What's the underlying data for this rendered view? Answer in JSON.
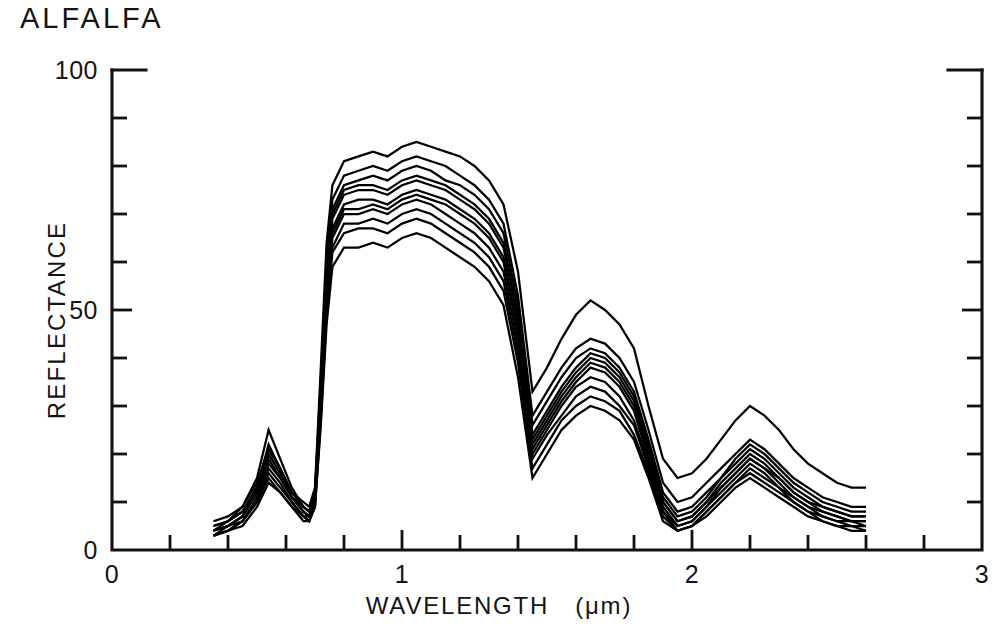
{
  "figure": {
    "title": "ALFALFA",
    "background_color": "#ffffff",
    "ink_color": "#000000"
  },
  "axes": {
    "y_title": "REFLECTANCE",
    "x_title_main": "WAVELENGTH",
    "x_title_unit": "(μm)",
    "y_tick_labels": [
      "0",
      "50",
      "100"
    ],
    "x_tick_labels": [
      "0",
      "1",
      "2",
      "3"
    ]
  },
  "chart_data": {
    "type": "line",
    "title": "ALFALFA",
    "subtitle": "",
    "xlabel": "WAVELENGTH  (μm)",
    "ylabel": "REFLECTANCE",
    "xlim": [
      0,
      3
    ],
    "ylim": [
      0,
      100
    ],
    "x_major_ticks": [
      0,
      1,
      2,
      3
    ],
    "x_minor_tick_step": 0.2,
    "y_major_ticks": [
      0,
      50,
      100
    ],
    "y_minor_tick_step": 10,
    "grid": false,
    "legend": null,
    "legend_position": "none",
    "annotations": [],
    "series_count": 11,
    "x": [
      0.35,
      0.4,
      0.45,
      0.5,
      0.54,
      0.58,
      0.62,
      0.66,
      0.68,
      0.7,
      0.72,
      0.74,
      0.76,
      0.8,
      0.85,
      0.9,
      0.95,
      1.0,
      1.05,
      1.1,
      1.15,
      1.2,
      1.25,
      1.3,
      1.35,
      1.4,
      1.45,
      1.5,
      1.55,
      1.6,
      1.65,
      1.7,
      1.75,
      1.8,
      1.85,
      1.9,
      1.95,
      2.0,
      2.05,
      2.1,
      2.15,
      2.2,
      2.25,
      2.3,
      2.35,
      2.4,
      2.45,
      2.5,
      2.55,
      2.6
    ],
    "series": [
      {
        "name": "sample-1",
        "values": [
          6,
          7,
          9,
          14,
          21,
          17,
          12,
          10,
          9,
          13,
          38,
          64,
          76,
          81,
          82,
          83,
          82,
          84,
          85,
          84,
          83,
          82,
          80,
          77,
          72,
          58,
          33,
          38,
          44,
          49,
          52,
          50,
          47,
          42,
          30,
          19,
          15,
          16,
          19,
          23,
          27,
          30,
          28,
          25,
          21,
          18,
          16,
          14,
          13,
          13
        ]
      },
      {
        "name": "sample-2",
        "values": [
          5,
          6,
          8,
          13,
          20,
          16,
          11,
          9,
          8,
          12,
          35,
          60,
          73,
          78,
          79,
          80,
          79,
          81,
          82,
          81,
          80,
          78,
          76,
          73,
          68,
          53,
          28,
          33,
          38,
          42,
          44,
          43,
          40,
          35,
          25,
          14,
          10,
          11,
          14,
          17,
          20,
          23,
          21,
          18,
          15,
          13,
          11,
          10,
          9,
          9
        ]
      },
      {
        "name": "sample-3",
        "values": [
          5,
          6,
          8,
          13,
          22,
          17,
          12,
          9,
          8,
          12,
          34,
          58,
          71,
          76,
          77,
          78,
          77,
          79,
          80,
          79,
          77,
          76,
          74,
          71,
          66,
          51,
          26,
          31,
          36,
          40,
          42,
          41,
          38,
          33,
          23,
          12,
          8,
          9,
          12,
          15,
          19,
          22,
          20,
          17,
          14,
          12,
          10,
          9,
          8,
          8
        ]
      },
      {
        "name": "sample-4",
        "values": [
          4,
          6,
          9,
          15,
          25,
          19,
          13,
          9,
          8,
          12,
          33,
          57,
          70,
          75,
          76,
          76,
          75,
          77,
          78,
          77,
          76,
          74,
          72,
          69,
          64,
          49,
          24,
          29,
          34,
          38,
          41,
          40,
          37,
          32,
          22,
          11,
          7,
          8,
          11,
          15,
          18,
          21,
          19,
          16,
          13,
          11,
          9,
          8,
          7,
          7
        ]
      },
      {
        "name": "sample-5",
        "values": [
          4,
          5,
          7,
          12,
          19,
          15,
          11,
          8,
          7,
          11,
          32,
          56,
          69,
          74,
          75,
          75,
          74,
          76,
          77,
          76,
          75,
          73,
          71,
          68,
          63,
          48,
          23,
          28,
          33,
          37,
          40,
          39,
          36,
          31,
          21,
          10,
          6,
          7,
          10,
          14,
          17,
          20,
          18,
          15,
          12,
          10,
          9,
          8,
          7,
          7
        ]
      },
      {
        "name": "sample-6",
        "values": [
          4,
          5,
          7,
          12,
          18,
          15,
          11,
          8,
          7,
          11,
          31,
          54,
          67,
          72,
          73,
          73,
          72,
          74,
          75,
          74,
          73,
          71,
          69,
          66,
          61,
          46,
          22,
          27,
          32,
          36,
          39,
          38,
          35,
          30,
          20,
          10,
          6,
          7,
          10,
          13,
          16,
          19,
          17,
          15,
          12,
          10,
          8,
          7,
          6,
          6
        ]
      },
      {
        "name": "sample-7",
        "values": [
          4,
          5,
          7,
          13,
          20,
          16,
          11,
          8,
          7,
          11,
          30,
          53,
          66,
          71,
          71,
          72,
          71,
          73,
          74,
          73,
          72,
          70,
          68,
          65,
          60,
          45,
          21,
          26,
          31,
          35,
          38,
          37,
          34,
          29,
          19,
          9,
          5,
          6,
          9,
          13,
          16,
          19,
          17,
          14,
          11,
          9,
          8,
          7,
          6,
          6
        ]
      },
      {
        "name": "sample-8",
        "values": [
          3,
          5,
          6,
          11,
          17,
          14,
          10,
          7,
          7,
          10,
          29,
          52,
          65,
          70,
          70,
          71,
          70,
          72,
          73,
          72,
          70,
          68,
          66,
          63,
          58,
          43,
          20,
          25,
          30,
          34,
          36,
          35,
          32,
          27,
          18,
          8,
          5,
          6,
          9,
          12,
          15,
          18,
          16,
          13,
          11,
          9,
          7,
          6,
          6,
          5
        ]
      },
      {
        "name": "sample-9",
        "values": [
          3,
          4,
          6,
          10,
          16,
          13,
          10,
          7,
          6,
          10,
          28,
          50,
          63,
          68,
          68,
          69,
          68,
          70,
          71,
          70,
          68,
          66,
          64,
          61,
          56,
          41,
          19,
          24,
          28,
          32,
          34,
          33,
          30,
          26,
          17,
          8,
          4,
          5,
          8,
          11,
          14,
          17,
          15,
          13,
          10,
          8,
          7,
          6,
          5,
          5
        ]
      },
      {
        "name": "sample-10",
        "values": [
          3,
          4,
          6,
          10,
          15,
          12,
          9,
          7,
          6,
          9,
          27,
          49,
          62,
          66,
          67,
          67,
          66,
          68,
          69,
          68,
          66,
          64,
          62,
          59,
          54,
          39,
          17,
          22,
          27,
          30,
          32,
          31,
          29,
          24,
          16,
          7,
          4,
          5,
          8,
          11,
          14,
          16,
          14,
          12,
          10,
          8,
          6,
          5,
          5,
          4
        ]
      },
      {
        "name": "sample-11",
        "values": [
          3,
          4,
          5,
          9,
          14,
          12,
          9,
          6,
          6,
          9,
          26,
          47,
          59,
          63,
          63,
          64,
          63,
          65,
          66,
          65,
          63,
          61,
          59,
          56,
          51,
          36,
          15,
          20,
          25,
          28,
          30,
          29,
          27,
          23,
          15,
          6,
          4,
          5,
          7,
          10,
          13,
          15,
          13,
          11,
          9,
          7,
          6,
          5,
          4,
          4
        ]
      }
    ]
  },
  "plot_geometry": {
    "left_px": 112,
    "right_px": 982,
    "top_px": 70,
    "bottom_px": 550
  }
}
